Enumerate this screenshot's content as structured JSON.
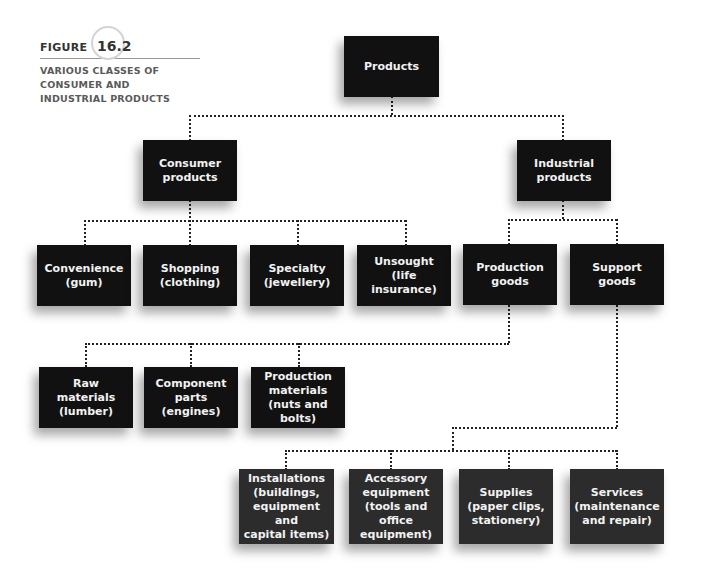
{
  "figure": {
    "label_word": "FIGURE",
    "number": "16.2",
    "caption": "VARIOUS CLASSES OF\nCONSUMER AND\nINDUSTRIAL PRODUCTS"
  },
  "nodes": {
    "products": "Products",
    "consumer": "Consumer\nproducts",
    "industrial": "Industrial\nproducts",
    "convenience": "Convenience\n(gum)",
    "shopping": "Shopping\n(clothing)",
    "specialty": "Specialty\n(jewellery)",
    "unsought": "Unsought\n(life insurance)",
    "production_goods": "Production\ngoods",
    "support_goods": "Support\ngoods",
    "raw_materials": "Raw materials\n(lumber)",
    "component_parts": "Component\nparts\n(engines)",
    "production_materials": "Production\nmaterials\n(nuts and bolts)",
    "installations": "Installations\n(buildings,\nequipment and\ncapital items)",
    "accessory_equipment": "Accessory\nequipment\n(tools and\noffice\nequipment)",
    "supplies": "Supplies\n(paper clips,\nstationery)",
    "services": "Services\n(maintenance\nand repair)"
  },
  "colors": {
    "box_dark": "#111111",
    "box_gray": "#2c2c2c",
    "connector": "#222222"
  }
}
